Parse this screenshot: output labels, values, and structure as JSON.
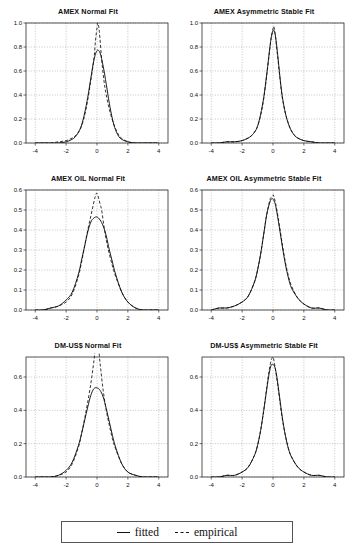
{
  "figure": {
    "legend": {
      "fitted_label": "fitted",
      "fitted_style": "solid",
      "empirical_label": "empirical",
      "empirical_style": "dashed",
      "line_color": "#111111"
    }
  },
  "chart_data": [
    {
      "type": "line",
      "title": "AMEX Normal Fit",
      "xlabel": "",
      "ylabel": "",
      "xlim": [
        -4.6,
        4.6
      ],
      "ylim": [
        0.0,
        1.0
      ],
      "xticks": [
        -4,
        -2,
        0,
        2,
        4
      ],
      "yticks": [
        0.0,
        0.2,
        0.4,
        0.6,
        0.8,
        1.0
      ],
      "ytick_labels": [
        "0.0",
        "0.2",
        "0.4",
        "0.6",
        "0.8",
        "1.0"
      ],
      "xtick_labels": [
        "-4",
        "-2",
        "0",
        "2",
        "4"
      ],
      "grid": true,
      "legend_position": "figure-bottom",
      "series": [
        {
          "name": "fitted",
          "style": "solid",
          "peak_x": -0.05,
          "peak_y": 0.77,
          "sigma": 0.52,
          "x": [
            -4.0,
            -3.5,
            -3.0,
            -2.5,
            -2.0,
            -1.5,
            -1.2,
            -1.0,
            -0.8,
            -0.6,
            -0.4,
            -0.2,
            0.0,
            0.2,
            0.4,
            0.6,
            0.8,
            1.0,
            1.2,
            1.5,
            2.0,
            2.5,
            3.0,
            3.5,
            4.0
          ],
          "y": [
            0.0,
            0.0,
            0.0,
            0.0,
            0.01,
            0.04,
            0.09,
            0.15,
            0.25,
            0.38,
            0.54,
            0.69,
            0.77,
            0.75,
            0.64,
            0.49,
            0.33,
            0.2,
            0.11,
            0.04,
            0.01,
            0.0,
            0.0,
            0.0,
            0.0
          ]
        },
        {
          "name": "empirical",
          "style": "dashed",
          "peak_x": 0.06,
          "peak_y": 1.0,
          "x": [
            -4.0,
            -3.5,
            -3.0,
            -2.5,
            -2.0,
            -1.5,
            -1.2,
            -1.0,
            -0.8,
            -0.6,
            -0.4,
            -0.2,
            -0.1,
            0.0,
            0.06,
            0.15,
            0.3,
            0.45,
            0.6,
            0.8,
            1.0,
            1.2,
            1.5,
            2.0,
            2.5,
            3.0,
            3.5,
            4.0
          ],
          "y": [
            0.0,
            0.0,
            0.0,
            0.01,
            0.02,
            0.05,
            0.09,
            0.14,
            0.23,
            0.36,
            0.52,
            0.7,
            0.85,
            0.96,
            1.0,
            0.93,
            0.7,
            0.52,
            0.4,
            0.28,
            0.19,
            0.12,
            0.05,
            0.01,
            0.0,
            0.0,
            0.0,
            0.0
          ]
        }
      ]
    },
    {
      "type": "line",
      "title": "AMEX Asymmetric Stable Fit",
      "xlabel": "",
      "ylabel": "",
      "xlim": [
        -4.6,
        4.6
      ],
      "ylim": [
        0.0,
        1.0
      ],
      "xticks": [
        -4,
        -2,
        0,
        2,
        4
      ],
      "yticks": [
        0.0,
        0.2,
        0.4,
        0.6,
        0.8,
        1.0
      ],
      "ytick_labels": [
        "0.0",
        "0.2",
        "0.4",
        "0.6",
        "0.8",
        "1.0"
      ],
      "xtick_labels": [
        "-4",
        "-2",
        "0",
        "2",
        "4"
      ],
      "grid": true,
      "legend_position": "figure-bottom",
      "series": [
        {
          "name": "fitted",
          "style": "solid",
          "peak_x": 0.03,
          "peak_y": 0.94,
          "x": [
            -4.0,
            -3.5,
            -3.0,
            -2.5,
            -2.0,
            -1.5,
            -1.2,
            -1.0,
            -0.8,
            -0.6,
            -0.4,
            -0.2,
            -0.1,
            0.03,
            0.15,
            0.3,
            0.45,
            0.6,
            0.8,
            1.0,
            1.2,
            1.5,
            2.0,
            2.5,
            3.0,
            3.5,
            4.0
          ],
          "y": [
            0.0,
            0.0,
            0.01,
            0.01,
            0.02,
            0.05,
            0.09,
            0.14,
            0.24,
            0.38,
            0.58,
            0.8,
            0.89,
            0.94,
            0.9,
            0.74,
            0.55,
            0.39,
            0.25,
            0.16,
            0.1,
            0.05,
            0.02,
            0.01,
            0.0,
            0.0,
            0.0
          ]
        },
        {
          "name": "empirical",
          "style": "dashed",
          "peak_x": 0.06,
          "peak_y": 0.97,
          "x": [
            -4.0,
            -3.5,
            -3.0,
            -2.5,
            -2.0,
            -1.5,
            -1.2,
            -1.0,
            -0.8,
            -0.6,
            -0.4,
            -0.2,
            -0.1,
            0.0,
            0.06,
            0.15,
            0.3,
            0.45,
            0.6,
            0.8,
            1.0,
            1.2,
            1.5,
            2.0,
            2.5,
            3.0,
            3.5,
            4.0
          ],
          "y": [
            0.0,
            0.0,
            0.01,
            0.01,
            0.02,
            0.05,
            0.09,
            0.14,
            0.23,
            0.37,
            0.57,
            0.79,
            0.89,
            0.95,
            0.97,
            0.89,
            0.72,
            0.54,
            0.38,
            0.25,
            0.16,
            0.1,
            0.05,
            0.02,
            0.01,
            0.0,
            0.0,
            0.0
          ]
        }
      ]
    },
    {
      "type": "line",
      "title": "AMEX OIL Normal Fit",
      "xlabel": "",
      "ylabel": "",
      "xlim": [
        -4.6,
        4.6
      ],
      "ylim": [
        0.0,
        0.6
      ],
      "xticks": [
        -4,
        -2,
        0,
        2,
        4
      ],
      "yticks": [
        0.0,
        0.1,
        0.2,
        0.3,
        0.4,
        0.5,
        0.6
      ],
      "ytick_labels": [
        "0.0",
        "0.1",
        "0.2",
        "0.3",
        "0.4",
        "0.5",
        "0.6"
      ],
      "xtick_labels": [
        "-4",
        "-2",
        "0",
        "2",
        "4"
      ],
      "grid": true,
      "legend_position": "figure-bottom",
      "series": [
        {
          "name": "fitted",
          "style": "solid",
          "peak_x": 0.0,
          "peak_y": 0.465,
          "sigma": 0.86,
          "x": [
            -4.0,
            -3.5,
            -3.0,
            -2.5,
            -2.0,
            -1.6,
            -1.2,
            -1.0,
            -0.8,
            -0.6,
            -0.4,
            -0.2,
            0.0,
            0.2,
            0.4,
            0.6,
            0.8,
            1.0,
            1.2,
            1.6,
            2.0,
            2.5,
            3.0,
            3.5,
            4.0
          ],
          "y": [
            0.0,
            0.0,
            0.01,
            0.02,
            0.05,
            0.09,
            0.18,
            0.25,
            0.32,
            0.39,
            0.44,
            0.46,
            0.465,
            0.45,
            0.42,
            0.37,
            0.3,
            0.24,
            0.18,
            0.09,
            0.04,
            0.01,
            0.0,
            0.0,
            0.0
          ]
        },
        {
          "name": "empirical",
          "style": "dashed",
          "peak_x": 0.0,
          "peak_y": 0.585,
          "x": [
            -4.0,
            -3.5,
            -3.0,
            -2.5,
            -2.0,
            -1.6,
            -1.2,
            -1.0,
            -0.8,
            -0.6,
            -0.4,
            -0.2,
            -0.1,
            0.0,
            0.1,
            0.2,
            0.3,
            0.45,
            0.6,
            0.8,
            1.0,
            1.2,
            1.6,
            2.0,
            2.5,
            3.0,
            3.5,
            4.0
          ],
          "y": [
            0.0,
            0.0,
            0.01,
            0.02,
            0.04,
            0.08,
            0.17,
            0.24,
            0.32,
            0.4,
            0.47,
            0.54,
            0.57,
            0.585,
            0.56,
            0.53,
            0.5,
            0.42,
            0.35,
            0.28,
            0.22,
            0.17,
            0.09,
            0.04,
            0.01,
            0.0,
            0.0,
            0.0
          ]
        }
      ]
    },
    {
      "type": "line",
      "title": "AMEX OIL Asymmetric Stable Fit",
      "xlabel": "",
      "ylabel": "",
      "xlim": [
        -4.6,
        4.6
      ],
      "ylim": [
        0.0,
        0.6
      ],
      "xticks": [
        -4,
        -2,
        0,
        2,
        4
      ],
      "yticks": [
        0.0,
        0.1,
        0.2,
        0.3,
        0.4,
        0.5,
        0.6
      ],
      "ytick_labels": [
        "0.0",
        "0.1",
        "0.2",
        "0.3",
        "0.4",
        "0.5",
        "0.6"
      ],
      "xtick_labels": [
        "-4",
        "-2",
        "0",
        "2",
        "4"
      ],
      "grid": true,
      "legend_position": "figure-bottom",
      "series": [
        {
          "name": "fitted",
          "style": "solid",
          "peak_x": 0.0,
          "peak_y": 0.555,
          "x": [
            -4.0,
            -3.5,
            -3.0,
            -2.5,
            -2.0,
            -1.6,
            -1.2,
            -1.0,
            -0.8,
            -0.6,
            -0.4,
            -0.2,
            -0.1,
            0.0,
            0.1,
            0.2,
            0.4,
            0.6,
            0.8,
            1.0,
            1.2,
            1.6,
            2.0,
            2.5,
            3.0,
            3.5,
            4.0
          ],
          "y": [
            0.0,
            0.01,
            0.01,
            0.02,
            0.04,
            0.07,
            0.14,
            0.2,
            0.28,
            0.38,
            0.48,
            0.54,
            0.555,
            0.555,
            0.54,
            0.51,
            0.42,
            0.32,
            0.23,
            0.16,
            0.11,
            0.06,
            0.03,
            0.01,
            0.01,
            0.0,
            0.0
          ]
        },
        {
          "name": "empirical",
          "style": "dashed",
          "peak_x": 0.02,
          "peak_y": 0.575,
          "x": [
            -4.0,
            -3.5,
            -3.0,
            -2.5,
            -2.0,
            -1.6,
            -1.2,
            -1.0,
            -0.8,
            -0.6,
            -0.4,
            -0.2,
            -0.1,
            0.0,
            0.02,
            0.12,
            0.25,
            0.4,
            0.6,
            0.8,
            1.0,
            1.2,
            1.6,
            2.0,
            2.5,
            3.0,
            3.5,
            4.0
          ],
          "y": [
            0.0,
            0.01,
            0.01,
            0.02,
            0.04,
            0.07,
            0.14,
            0.2,
            0.28,
            0.38,
            0.48,
            0.55,
            0.565,
            0.57,
            0.575,
            0.55,
            0.5,
            0.43,
            0.33,
            0.24,
            0.17,
            0.12,
            0.06,
            0.03,
            0.01,
            0.01,
            0.0,
            0.0
          ]
        }
      ]
    },
    {
      "type": "line",
      "title": "DM-US$ Normal Fit",
      "xlabel": "",
      "ylabel": "",
      "xlim": [
        -4.6,
        4.6
      ],
      "ylim": [
        0.0,
        0.72
      ],
      "xticks": [
        -4,
        -2,
        0,
        2,
        4
      ],
      "yticks": [
        0.0,
        0.2,
        0.4,
        0.6
      ],
      "ytick_labels": [
        "0.0",
        "0.2",
        "0.4",
        "0.6"
      ],
      "xtick_labels": [
        "-4",
        "-2",
        "0",
        "2",
        "4"
      ],
      "grid": true,
      "legend_position": "figure-bottom",
      "series": [
        {
          "name": "fitted",
          "style": "solid",
          "peak_x": 0.0,
          "peak_y": 0.535,
          "sigma": 0.75,
          "x": [
            -4.0,
            -3.5,
            -3.0,
            -2.5,
            -2.0,
            -1.6,
            -1.2,
            -1.0,
            -0.8,
            -0.6,
            -0.4,
            -0.2,
            0.0,
            0.2,
            0.4,
            0.6,
            0.8,
            1.0,
            1.2,
            1.6,
            2.0,
            2.5,
            3.0,
            3.5,
            4.0
          ],
          "y": [
            0.0,
            0.0,
            0.0,
            0.01,
            0.04,
            0.09,
            0.19,
            0.26,
            0.34,
            0.42,
            0.49,
            0.53,
            0.535,
            0.52,
            0.48,
            0.41,
            0.33,
            0.25,
            0.18,
            0.08,
            0.03,
            0.01,
            0.0,
            0.0,
            0.0
          ]
        },
        {
          "name": "empirical",
          "style": "dashed",
          "peak_x": 0.0,
          "peak_y": 0.92,
          "x": [
            -4.0,
            -3.5,
            -3.0,
            -2.5,
            -2.0,
            -1.6,
            -1.2,
            -1.0,
            -0.8,
            -0.6,
            -0.4,
            -0.25,
            -0.15,
            -0.08,
            0.0,
            0.08,
            0.15,
            0.25,
            0.4,
            0.6,
            0.8,
            1.0,
            1.2,
            1.6,
            2.0,
            2.5,
            3.0,
            3.5,
            4.0
          ],
          "y": [
            0.0,
            0.0,
            0.0,
            0.01,
            0.03,
            0.08,
            0.18,
            0.26,
            0.35,
            0.45,
            0.56,
            0.66,
            0.74,
            0.84,
            0.92,
            0.83,
            0.73,
            0.64,
            0.52,
            0.4,
            0.31,
            0.23,
            0.17,
            0.08,
            0.03,
            0.01,
            0.0,
            0.0,
            0.0
          ]
        }
      ]
    },
    {
      "type": "line",
      "title": "DM-US$ Asymmetric Stable Fit",
      "xlabel": "",
      "ylabel": "",
      "xlim": [
        -4.6,
        4.6
      ],
      "ylim": [
        0.0,
        0.72
      ],
      "xticks": [
        -4,
        -2,
        0,
        2,
        4
      ],
      "yticks": [
        0.0,
        0.2,
        0.4,
        0.6
      ],
      "ytick_labels": [
        "0.0",
        "0.2",
        "0.4",
        "0.6"
      ],
      "xtick_labels": [
        "-4",
        "-2",
        "0",
        "2",
        "4"
      ],
      "grid": true,
      "legend_position": "figure-bottom",
      "series": [
        {
          "name": "fitted",
          "style": "solid",
          "peak_x": 0.0,
          "peak_y": 0.675,
          "x": [
            -4.0,
            -3.5,
            -3.0,
            -2.5,
            -2.0,
            -1.6,
            -1.2,
            -1.0,
            -0.8,
            -0.6,
            -0.4,
            -0.25,
            -0.12,
            0.0,
            0.12,
            0.25,
            0.4,
            0.6,
            0.8,
            1.0,
            1.2,
            1.6,
            2.0,
            2.5,
            3.0,
            3.5,
            4.0
          ],
          "y": [
            0.0,
            0.0,
            0.01,
            0.01,
            0.03,
            0.06,
            0.13,
            0.19,
            0.28,
            0.4,
            0.53,
            0.62,
            0.67,
            0.675,
            0.66,
            0.6,
            0.5,
            0.36,
            0.25,
            0.17,
            0.12,
            0.06,
            0.03,
            0.01,
            0.01,
            0.0,
            0.0
          ]
        },
        {
          "name": "empirical",
          "style": "dashed",
          "peak_x": 0.0,
          "peak_y": 0.72,
          "x": [
            -4.0,
            -3.5,
            -3.0,
            -2.5,
            -2.0,
            -1.6,
            -1.2,
            -1.0,
            -0.8,
            -0.6,
            -0.4,
            -0.25,
            -0.12,
            -0.05,
            0.0,
            0.06,
            0.15,
            0.28,
            0.42,
            0.6,
            0.8,
            1.0,
            1.2,
            1.6,
            2.0,
            2.5,
            3.0,
            3.5,
            4.0
          ],
          "y": [
            0.0,
            0.0,
            0.01,
            0.01,
            0.03,
            0.06,
            0.13,
            0.19,
            0.28,
            0.4,
            0.54,
            0.64,
            0.7,
            0.715,
            0.72,
            0.7,
            0.65,
            0.57,
            0.47,
            0.35,
            0.25,
            0.17,
            0.12,
            0.06,
            0.03,
            0.01,
            0.01,
            0.0,
            0.0
          ]
        }
      ]
    }
  ]
}
